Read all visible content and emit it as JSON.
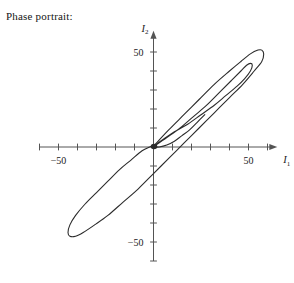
{
  "caption": "Phase portrait:",
  "axes": {
    "x_name": "I",
    "x_sub": "1",
    "y_name": "I",
    "y_sub": "2",
    "x_labels": [
      {
        "text": "-50",
        "value": -50
      },
      {
        "text": "50",
        "value": 50
      }
    ],
    "y_labels": [
      {
        "text": "50",
        "value": 50
      },
      {
        "text": "-50",
        "value": -50
      }
    ],
    "tick_step": 10,
    "x_range": [
      -60,
      62
    ],
    "y_range": [
      -60,
      58
    ],
    "origin_marker": true
  },
  "style": {
    "curve_color": "#2b2b2b",
    "axis_color": "#545454",
    "text_color": "#1a1a1a",
    "background": "#ffffff",
    "curve_width": 1.1,
    "axis_width": 1.0
  },
  "chart_data": {
    "type": "line",
    "title": "Phase portrait:",
    "xlabel": "I1",
    "ylabel": "I2",
    "xlim": [
      -60,
      62
    ],
    "ylim": [
      -60,
      58
    ],
    "grid": false,
    "legend": "none",
    "tick_step": 10,
    "annotations": [
      {
        "text": "origin fixed point",
        "x": 0,
        "y": 0,
        "marker": "filled-dot"
      }
    ],
    "series": [
      {
        "name": "outer orbit",
        "closed": true,
        "comment": "large elongated loop, lower-left tip near (-42,-45), upper-right tip near (55,50), passing through origin region",
        "points": [
          [
            0.5,
            1.0
          ],
          [
            8,
            9
          ],
          [
            16,
            17
          ],
          [
            24,
            25
          ],
          [
            32,
            33
          ],
          [
            40,
            40
          ],
          [
            46,
            45
          ],
          [
            51,
            49
          ],
          [
            55,
            51
          ],
          [
            57,
            51
          ],
          [
            58,
            49
          ],
          [
            57,
            45
          ],
          [
            53,
            40
          ],
          [
            47,
            33
          ],
          [
            40,
            26
          ],
          [
            32,
            18
          ],
          [
            24,
            10
          ],
          [
            16,
            2
          ],
          [
            8,
            -6
          ],
          [
            0,
            -14
          ],
          [
            -8,
            -22
          ],
          [
            -16,
            -29
          ],
          [
            -24,
            -36
          ],
          [
            -31,
            -41
          ],
          [
            -37,
            -45
          ],
          [
            -41,
            -47
          ],
          [
            -44,
            -47
          ],
          [
            -45,
            -45
          ],
          [
            -44,
            -41
          ],
          [
            -41,
            -36
          ],
          [
            -36,
            -30
          ],
          [
            -30,
            -24
          ],
          [
            -24,
            -18
          ],
          [
            -18,
            -12
          ],
          [
            -12,
            -7
          ],
          [
            -6,
            -2
          ],
          [
            -2,
            0
          ],
          [
            0.5,
            1.0
          ]
        ]
      },
      {
        "name": "inner orbit",
        "closed": true,
        "comment": "narrower loop nested inside the outer one, upper-right tip near (50,44), lower return through origin",
        "points": [
          [
            0.5,
            0.5
          ],
          [
            7,
            5
          ],
          [
            14,
            10
          ],
          [
            21,
            16
          ],
          [
            28,
            22
          ],
          [
            35,
            29
          ],
          [
            41,
            35
          ],
          [
            46,
            40
          ],
          [
            49,
            43
          ],
          [
            51,
            44
          ],
          [
            52,
            43
          ],
          [
            51,
            40
          ],
          [
            48,
            36
          ],
          [
            44,
            32
          ],
          [
            38,
            27
          ],
          [
            32,
            22
          ],
          [
            25,
            17
          ],
          [
            18,
            12
          ],
          [
            11,
            8
          ],
          [
            5,
            4
          ],
          [
            1.5,
            1.5
          ],
          [
            0.5,
            0.5
          ]
        ]
      },
      {
        "name": "transient inbound arc",
        "closed": false,
        "comment": "short arc sweeping up from origin to the right, merging into the inner loop",
        "points": [
          [
            0,
            0
          ],
          [
            3,
            0
          ],
          [
            7,
            1
          ],
          [
            11,
            3
          ],
          [
            15,
            6
          ],
          [
            19,
            9
          ],
          [
            23,
            13
          ],
          [
            27,
            17
          ]
        ]
      }
    ]
  }
}
